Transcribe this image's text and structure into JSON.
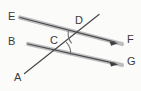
{
  "figure": {
    "background_color": "#fbfbfa",
    "canvas": {
      "width": 141,
      "height": 91
    },
    "labels": {
      "E": "E",
      "D": "D",
      "F": "F",
      "B": "B",
      "C": "C",
      "G": "G",
      "A": "A"
    },
    "label_color": "#3a3a3c",
    "line_color": "#4a4a4e",
    "highlight_color": "#b9b9bb",
    "arc_color": "#6e6e72",
    "points": {
      "E": {
        "x": 18,
        "y": 17
      },
      "D": {
        "x": 80,
        "y": 33
      },
      "F": {
        "x": 121,
        "y": 41
      },
      "B": {
        "x": 18,
        "y": 42
      },
      "C": {
        "x": 57,
        "y": 50
      },
      "G": {
        "x": 121,
        "y": 62
      },
      "A": {
        "x": 24,
        "y": 75
      },
      "transversal_top": {
        "x": 98,
        "y": 15
      }
    },
    "lines": [
      {
        "name": "line-E-F",
        "from": "E",
        "to": "F",
        "through": "D",
        "style": "highlighted-with-arrow",
        "arrow_at": "F"
      },
      {
        "name": "line-B-G",
        "from": "B",
        "to": "G",
        "through": "C",
        "style": "highlighted-with-arrow",
        "arrow_at": "G"
      },
      {
        "name": "transversal-A-D",
        "from": "A",
        "to": "transversal_top",
        "through": "C,D",
        "style": "plain",
        "arrow_at": "none"
      }
    ],
    "angle_marks": [
      {
        "name": "angle-at-D",
        "vertex": "D",
        "arc_count": 1
      },
      {
        "name": "angle-at-C",
        "vertex": "C",
        "arc_count": 1
      }
    ]
  }
}
